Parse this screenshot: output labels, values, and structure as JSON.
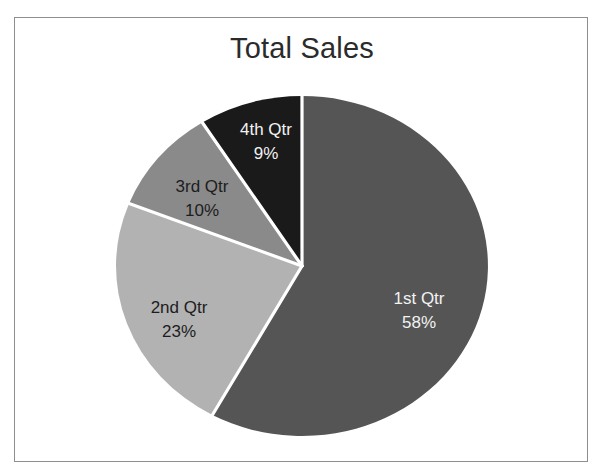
{
  "chart": {
    "title": "Total Sales",
    "frame_border_color": "#8e8e8e",
    "background_color": "#ffffff",
    "divider_color": "#ffffff"
  },
  "chart_data": {
    "type": "pie",
    "title": "Total Sales",
    "xlabel": "",
    "ylabel": "",
    "categories": [
      "1st Qtr",
      "2nd Qtr",
      "3rd Qtr",
      "4th Qtr"
    ],
    "values": [
      58,
      23,
      10,
      9
    ],
    "value_unit": "%",
    "start_angle_deg": 0,
    "direction": "clockwise",
    "legend": "none",
    "grid": false,
    "slices": [
      {
        "label": "1st Qtr",
        "percent_text": "58%",
        "value": 58,
        "color": "#555555",
        "label_color": "#f2f2f2",
        "label_x": 404,
        "label_y": 282
      },
      {
        "label": "2nd Qtr",
        "percent_text": "23%",
        "value": 23,
        "color": "#b2b2b2",
        "label_color": "#1d1d1d",
        "label_x": 164,
        "label_y": 291
      },
      {
        "label": "3rd Qtr",
        "percent_text": "10%",
        "value": 10,
        "color": "#8a8a8a",
        "label_color": "#1d1d1d",
        "label_x": 187,
        "label_y": 170
      },
      {
        "label": "4th Qtr",
        "percent_text": "9%",
        "value": 9,
        "color": "#1a1a1a",
        "label_color": "#f2f2f2",
        "label_x": 251,
        "label_y": 113
      }
    ]
  }
}
